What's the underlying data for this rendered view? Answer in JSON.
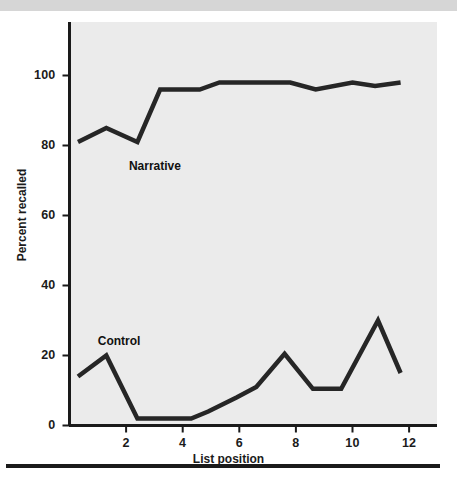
{
  "figure": {
    "background_color": "#ffffff",
    "panel_color": "#ebebeb",
    "line_color": "#262626",
    "axis_color": "#1a1a1a",
    "top_band_color": "#d6d6d6"
  },
  "axes": {
    "x_title": "List position",
    "y_title": "Percent recalled",
    "x_ticks": [
      "2",
      "4",
      "6",
      "8",
      "10",
      "12"
    ],
    "y_ticks": [
      "0",
      "20",
      "40",
      "60",
      "80",
      "100"
    ]
  },
  "annotations": {
    "narrative_label": "Narrative",
    "control_label": "Control"
  },
  "chart_data": {
    "type": "line",
    "title": "",
    "xlabel": "List position",
    "ylabel": "Percent recalled",
    "xlim": [
      0,
      13
    ],
    "ylim": [
      0,
      108
    ],
    "grid": false,
    "legend": "inline-labels",
    "x_ticks": [
      2,
      4,
      6,
      8,
      10,
      12
    ],
    "y_ticks": [
      0,
      20,
      40,
      60,
      80,
      100
    ],
    "series": [
      {
        "name": "Narrative",
        "label_position": {
          "x": 2.1,
          "y": 74
        },
        "x": [
          0.3,
          1.3,
          2.4,
          3.2,
          4.6,
          5.3,
          7.0,
          7.8,
          8.7,
          10.0,
          10.8,
          11.7
        ],
        "values": [
          81,
          85,
          81,
          96,
          96,
          98,
          98,
          98,
          96,
          98,
          97,
          98
        ]
      },
      {
        "name": "Control",
        "label_position": {
          "x": 1.0,
          "y": 24
        },
        "x": [
          0.3,
          1.3,
          2.4,
          3.2,
          4.3,
          4.9,
          5.9,
          6.6,
          7.6,
          8.6,
          9.6,
          10.9,
          11.7
        ],
        "values": [
          14,
          20,
          2,
          2,
          2,
          4,
          8,
          11,
          20.5,
          10.5,
          10.5,
          30,
          15
        ]
      }
    ]
  }
}
